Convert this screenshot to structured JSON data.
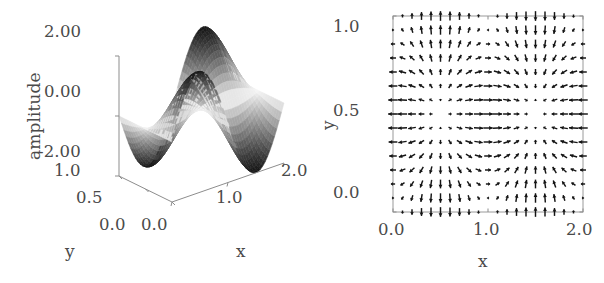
{
  "figure": {
    "panels": [
      "surface-3d",
      "vector-field-2d"
    ],
    "background_color": "#ffffff",
    "line_color": "#141414",
    "axis_color": "#8d8d8d"
  },
  "chart_data": [
    {
      "type": "surface",
      "id": "surface-3d",
      "title": "",
      "xlabel": "x",
      "ylabel": "y",
      "zlabel": "amplitude",
      "xlim": [
        0.0,
        2.0
      ],
      "ylim": [
        0.0,
        1.0
      ],
      "zlim": [
        -2.0,
        2.0
      ],
      "xticks": [
        "0.0",
        "1.0",
        "2.0"
      ],
      "xtick_values": [
        0.0,
        1.0,
        2.0
      ],
      "yticks": [
        "0.0",
        "0.5",
        "1.0"
      ],
      "ytick_values": [
        0.0,
        0.5,
        1.0
      ],
      "zticks": [
        "-2.00",
        "0.00",
        "2.00"
      ],
      "ztick_values": [
        -2.0,
        0.0,
        2.0
      ],
      "grid": false,
      "legend": "none",
      "colormap": "grayscale",
      "description": "Standing wave mode amplitude over the unit-by-two domain; one positive lobe and one negative lobe along x, saddle shaped along y.",
      "function": "2*sin(pi*x)*cos(pi*y)",
      "samples_x": 48,
      "samples_y": 24,
      "view_azimuth_deg": -60,
      "view_elevation_deg": 24
    },
    {
      "type": "quiver",
      "id": "vector-field-2d",
      "title": "",
      "xlabel": "x",
      "ylabel": "y",
      "xlim": [
        0.0,
        2.0
      ],
      "ylim": [
        0.0,
        1.0
      ],
      "xticks": [
        "0.0",
        "1.0",
        "2.0"
      ],
      "xtick_values": [
        0.0,
        1.0,
        2.0
      ],
      "yticks": [
        "0.0",
        "0.5",
        "1.0"
      ],
      "ytick_values": [
        0.0,
        0.5,
        1.0
      ],
      "grid": false,
      "legend": "none",
      "frame": true,
      "grid_nx": 21,
      "grid_ny": 15,
      "description": "In-plane displacement / gradient field of the standing wave. Arrows converge toward x = 1.0 along the top and bottom edges and splay outward toward the left and right walls, with stagnation points near (0.5, 0.5) and (1.5, 0.5).",
      "u_function": "-cos(pi*x)*sin(pi*y)",
      "v_function": "-sin(pi*x)*cos(pi*y)",
      "arrow_color": "#141414"
    }
  ],
  "surface_panel": {
    "zlabel": "amplitude",
    "z_ticks": [
      {
        "label": "2.00",
        "value": 2.0
      },
      {
        "label": "0.00",
        "value": 0.0
      },
      {
        "label": "-2.00",
        "value": -2.0
      }
    ],
    "y_ticks": [
      {
        "label": "1.0",
        "value": 1.0
      },
      {
        "label": "0.5",
        "value": 0.5
      },
      {
        "label": "0.0",
        "value": 0.0
      }
    ],
    "x_ticks": [
      {
        "label": "0.0",
        "value": 0.0
      },
      {
        "label": "1.0",
        "value": 1.0
      },
      {
        "label": "2.0",
        "value": 2.0
      }
    ],
    "x_axis_label": "x",
    "y_axis_label": "y"
  },
  "field_panel": {
    "y_ticks": [
      {
        "label": "1.0",
        "value": 1.0
      },
      {
        "label": "0.5",
        "value": 0.5
      },
      {
        "label": "0.0",
        "value": 0.0
      }
    ],
    "x_ticks": [
      {
        "label": "0.0",
        "value": 0.0
      },
      {
        "label": "1.0",
        "value": 1.0
      },
      {
        "label": "2.0",
        "value": 2.0
      }
    ],
    "x_axis_label": "x",
    "y_axis_label": "y"
  }
}
